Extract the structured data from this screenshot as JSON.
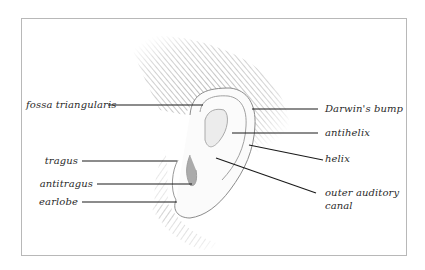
{
  "diagram": {
    "labels_left": [
      {
        "id": "fossa",
        "text": "fossa triangularis"
      },
      {
        "id": "tragus",
        "text": "tragus"
      },
      {
        "id": "antitragus",
        "text": "antitragus"
      },
      {
        "id": "earlobe",
        "text": "earlobe"
      }
    ],
    "labels_right": [
      {
        "id": "darwin",
        "text": "Darwin's bump"
      },
      {
        "id": "antihelix",
        "text": "antihelix"
      },
      {
        "id": "helix",
        "text": "helix"
      },
      {
        "id": "canal_line1",
        "text": "outer auditory"
      },
      {
        "id": "canal_line2",
        "text": "canal"
      }
    ]
  },
  "colors": {
    "frame_border": "#b8b8b8",
    "leader_line": "#1a1a1a",
    "label_text": "#2a2a2a",
    "shading": "#8a8a8a"
  }
}
